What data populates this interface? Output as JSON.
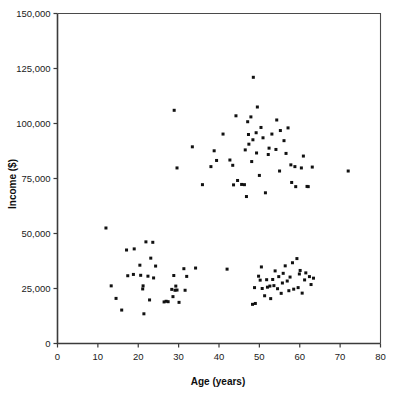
{
  "figure": {
    "background_color": "#ffffff",
    "axis_color": "#3b3b3b",
    "point_color": "#111111"
  },
  "chart_data": {
    "type": "scatter",
    "title": "",
    "xlabel": "Age (years)",
    "ylabel": "Income ($)",
    "xlim": [
      0,
      80
    ],
    "ylim": [
      0,
      150000
    ],
    "xticks": [
      0,
      10,
      20,
      30,
      40,
      50,
      60,
      70,
      80
    ],
    "xtick_labels": [
      "0",
      "10",
      "20",
      "30",
      "40",
      "50",
      "60",
      "70",
      "80"
    ],
    "yticks": [
      0,
      25000,
      50000,
      75000,
      100000,
      125000,
      150000
    ],
    "ytick_labels": [
      "0",
      "25,000",
      "50,000",
      "75,000",
      "100,000",
      "125,000",
      "150,000"
    ],
    "grid": false,
    "legend": false,
    "marker": "square",
    "marker_size_px": 3,
    "series": [
      {
        "name": "Age vs Income",
        "points": [
          [
            12.0,
            52500
          ],
          [
            13.3,
            26200
          ],
          [
            14.5,
            20500
          ],
          [
            15.9,
            15200
          ],
          [
            17.1,
            42500
          ],
          [
            17.4,
            30800
          ],
          [
            18.8,
            31400
          ],
          [
            19.0,
            43000
          ],
          [
            20.4,
            35600
          ],
          [
            20.6,
            31000
          ],
          [
            21.1,
            24800
          ],
          [
            21.2,
            26200
          ],
          [
            21.4,
            13500
          ],
          [
            21.9,
            46200
          ],
          [
            22.4,
            30600
          ],
          [
            22.8,
            19800
          ],
          [
            23.1,
            38800
          ],
          [
            23.6,
            46000
          ],
          [
            23.8,
            29800
          ],
          [
            24.3,
            35200
          ],
          [
            26.4,
            18900
          ],
          [
            26.9,
            19200
          ],
          [
            27.4,
            19000
          ],
          [
            28.3,
            24600
          ],
          [
            28.6,
            21300
          ],
          [
            28.8,
            30900
          ],
          [
            29.1,
            24200
          ],
          [
            29.3,
            26100
          ],
          [
            29.6,
            24300
          ],
          [
            30.1,
            18700
          ],
          [
            31.3,
            34000
          ],
          [
            31.6,
            24200
          ],
          [
            32.0,
            30500
          ],
          [
            34.2,
            34300
          ],
          [
            28.9,
            106000
          ],
          [
            29.6,
            79800
          ],
          [
            33.4,
            89400
          ],
          [
            35.9,
            72200
          ],
          [
            38.0,
            80400
          ],
          [
            38.8,
            87600
          ],
          [
            39.4,
            83200
          ],
          [
            41.0,
            95200
          ],
          [
            42.0,
            33800
          ],
          [
            42.7,
            83400
          ],
          [
            43.4,
            81000
          ],
          [
            43.6,
            72100
          ],
          [
            44.2,
            103500
          ],
          [
            44.6,
            74100
          ],
          [
            45.6,
            72300
          ],
          [
            46.3,
            72200
          ],
          [
            46.5,
            88000
          ],
          [
            46.8,
            66800
          ],
          [
            47.1,
            100800
          ],
          [
            47.3,
            95000
          ],
          [
            47.4,
            90600
          ],
          [
            47.9,
            103000
          ],
          [
            48.1,
            82700
          ],
          [
            48.3,
            17800
          ],
          [
            48.4,
            92600
          ],
          [
            48.5,
            121000
          ],
          [
            48.8,
            25400
          ],
          [
            49.0,
            18200
          ],
          [
            49.2,
            95800
          ],
          [
            49.3,
            86600
          ],
          [
            49.5,
            107500
          ],
          [
            49.8,
            30600
          ],
          [
            50.0,
            76400
          ],
          [
            50.2,
            28800
          ],
          [
            50.4,
            98200
          ],
          [
            50.5,
            34800
          ],
          [
            50.7,
            25000
          ],
          [
            50.9,
            93500
          ],
          [
            51.3,
            21700
          ],
          [
            51.5,
            68500
          ],
          [
            51.8,
            29000
          ],
          [
            52.0,
            25600
          ],
          [
            52.2,
            85900
          ],
          [
            52.4,
            88800
          ],
          [
            52.6,
            26100
          ],
          [
            52.8,
            20400
          ],
          [
            53.1,
            95200
          ],
          [
            53.3,
            29100
          ],
          [
            53.6,
            26300
          ],
          [
            53.9,
            33000
          ],
          [
            54.1,
            88200
          ],
          [
            54.3,
            101600
          ],
          [
            54.5,
            24900
          ],
          [
            54.8,
            30400
          ],
          [
            55.0,
            78400
          ],
          [
            55.2,
            96800
          ],
          [
            55.4,
            22800
          ],
          [
            55.7,
            27500
          ],
          [
            55.9,
            31900
          ],
          [
            56.1,
            92200
          ],
          [
            56.4,
            35300
          ],
          [
            56.6,
            86400
          ],
          [
            56.9,
            28400
          ],
          [
            57.1,
            98000
          ],
          [
            57.3,
            24000
          ],
          [
            57.6,
            30200
          ],
          [
            57.8,
            81200
          ],
          [
            58.0,
            73200
          ],
          [
            58.2,
            36700
          ],
          [
            58.5,
            24700
          ],
          [
            58.8,
            80400
          ],
          [
            59.0,
            71300
          ],
          [
            59.3,
            38600
          ],
          [
            59.6,
            25400
          ],
          [
            59.9,
            31600
          ],
          [
            60.1,
            33200
          ],
          [
            60.4,
            79800
          ],
          [
            60.6,
            22900
          ],
          [
            60.9,
            85200
          ],
          [
            61.2,
            28900
          ],
          [
            61.5,
            32100
          ],
          [
            61.8,
            71400
          ],
          [
            62.1,
            71300
          ],
          [
            62.4,
            30400
          ],
          [
            62.8,
            26800
          ],
          [
            63.1,
            80200
          ],
          [
            63.4,
            29700
          ],
          [
            72.0,
            78400
          ]
        ]
      }
    ]
  }
}
